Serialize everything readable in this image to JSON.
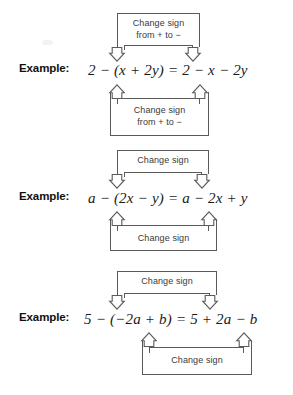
{
  "page": {
    "background_color": "#ffffff",
    "line_color": "#5a5a5a",
    "text_color": "#2b2b2b"
  },
  "examples": [
    {
      "label": "Example:",
      "equation": "2 − (x + 2y) = 2 − x − 2y",
      "top_bracket": {
        "label_lines": [
          "Change sign",
          "from + to −"
        ],
        "arrow_direction": "down",
        "arrow_count": 2
      },
      "bottom_bracket": {
        "label_lines": [
          "Change sign",
          "from + to −"
        ],
        "arrow_direction": "up",
        "arrow_count": 2
      }
    },
    {
      "label": "Example:",
      "equation": "a − (2x − y) = a − 2x + y",
      "top_bracket": {
        "label_lines": [
          "Change sign"
        ],
        "arrow_direction": "down",
        "arrow_count": 2
      },
      "bottom_bracket": {
        "label_lines": [
          "Change sign"
        ],
        "arrow_direction": "up",
        "arrow_count": 2
      }
    },
    {
      "label": "Example:",
      "equation": "5 − (−2a + b) = 5 + 2a − b",
      "top_bracket": {
        "label_lines": [
          "Change sign"
        ],
        "arrow_direction": "down",
        "arrow_count": 2
      },
      "bottom_bracket": {
        "label_lines": [
          "Change sign"
        ],
        "arrow_direction": "up",
        "arrow_count": 2
      }
    }
  ]
}
